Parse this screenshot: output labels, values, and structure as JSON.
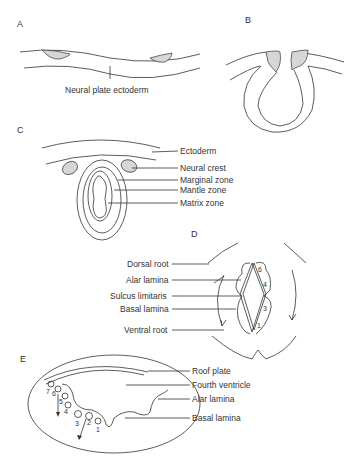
{
  "figure": {
    "panels": {
      "A": {
        "letter": "A",
        "labels": [
          "Neural plate ectoderm"
        ]
      },
      "B": {
        "letter": "B",
        "labels": []
      },
      "C": {
        "letter": "C",
        "labels": [
          "Ectoderm",
          "Neural crest",
          "Marginal zone",
          "Mantle zone",
          "Matrix zone"
        ]
      },
      "D": {
        "letter": "D",
        "labels": [
          "Dorsal root",
          "Alar lamina",
          "Sulcus limitaris",
          "Basal lamina",
          "Ventral root"
        ],
        "region_numbers": [
          "6",
          "4",
          "3",
          "1"
        ]
      },
      "E": {
        "letter": "E",
        "labels": [
          "Roof plate",
          "Fourth ventricle",
          "Alar lamina",
          "Basal lamina"
        ],
        "nucleus_numbers": [
          "1",
          "2",
          "3",
          "4",
          "5",
          "6",
          "7"
        ]
      }
    },
    "colors": {
      "line": "#333333",
      "shading": "#d6d6d6",
      "background": "#ffffff"
    }
  }
}
